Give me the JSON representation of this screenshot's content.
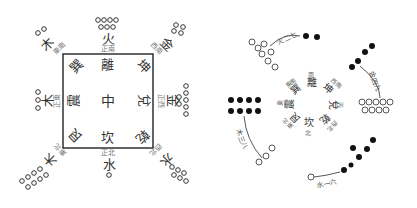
{
  "diagram": {
    "left": {
      "title": "Luoshu square with trigrams and numbers",
      "center": "中",
      "box_trigrams": {
        "top": "離",
        "top_left": "巽",
        "top_right": "坤",
        "left": "震",
        "right": "兌",
        "bottom_left": "艮",
        "bottom": "坎",
        "bottom_right": "乾"
      },
      "outer_elements": {
        "top": "火",
        "top_left": "木",
        "top_right": "金",
        "left": "木",
        "right": "金",
        "bottom_left": "木",
        "bottom": "水",
        "bottom_right": "水"
      },
      "direction_labels": {
        "top": "正南",
        "top_left": "東南",
        "top_right": "西南",
        "left": "正東",
        "right": "正西",
        "bottom_left": "東北",
        "bottom": "正北",
        "bottom_right": "西北"
      },
      "dot_counts": {
        "top": 9,
        "top_left": 4,
        "top_right": 2,
        "left": 3,
        "right": 7,
        "bottom_left": 8,
        "bottom": 1,
        "bottom_right": 6
      }
    },
    "right": {
      "title": "Spiral arrangement with yin/yang dots",
      "ring_chars": [
        "離",
        "南",
        "坤",
        "西南",
        "兌",
        "西",
        "乾",
        "西北",
        "坎",
        "北",
        "艮",
        "東北",
        "震",
        "東",
        "巽",
        "東南"
      ],
      "arms": [
        {
          "position": "top",
          "label": "火二七",
          "filled": 2,
          "hollow": 7
        },
        {
          "position": "right",
          "label": "金四九",
          "filled": 4,
          "hollow": 9
        },
        {
          "position": "bottom",
          "label": "水一六",
          "filled": 6,
          "hollow": 1
        },
        {
          "position": "left",
          "label": "木三八",
          "filled": 8,
          "hollow": 3
        }
      ]
    },
    "colors": {
      "ink": "#222222",
      "faint": "#777777",
      "background": "#ffffff"
    }
  }
}
